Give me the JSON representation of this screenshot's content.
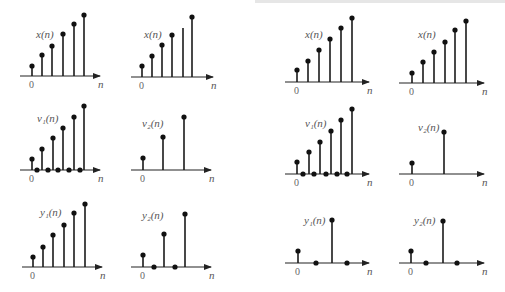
{
  "figure": {
    "colors": {
      "stem": "#1a1a1a",
      "label": "#555555",
      "background": "#ffffff"
    }
  },
  "panels": [
    {
      "id": "L-r1-c1",
      "label": "x(n)",
      "origin_label": "0",
      "axis_label": "n",
      "axis": {
        "x0": 20,
        "x1": 100,
        "y": 76
      },
      "zero_x": 32,
      "label_pos": [
        36,
        38
      ],
      "stems": [
        {
          "x": 32,
          "y": 66
        },
        {
          "x": 42,
          "y": 55
        },
        {
          "x": 52,
          "y": 46
        },
        {
          "x": 63,
          "y": 34
        },
        {
          "x": 74,
          "y": 24
        },
        {
          "x": 84,
          "y": 15
        }
      ],
      "zeros": []
    },
    {
      "id": "L-r1-c2",
      "label": "x(n)",
      "origin_label": "0",
      "axis_label": "n",
      "axis": {
        "x0": 131,
        "x1": 213,
        "y": 77
      },
      "zero_x": 142,
      "label_pos": [
        144,
        38
      ],
      "stems": [
        {
          "x": 142,
          "y": 66
        },
        {
          "x": 152,
          "y": 56
        },
        {
          "x": 162,
          "y": 45
        },
        {
          "x": 172,
          "y": 35
        },
        {
          "x": 183,
          "y": 28,
          "nodot": true
        },
        {
          "x": 192,
          "y": 17
        }
      ],
      "zeros": []
    },
    {
      "id": "L-r2-c1",
      "label": "v₁(n)",
      "origin_label": "0",
      "axis_label": "n",
      "axis": {
        "x0": 20,
        "x1": 100,
        "y": 170
      },
      "zero_x": 32,
      "label_pos": [
        37,
        122
      ],
      "stems": [
        {
          "x": 32,
          "y": 159
        },
        {
          "x": 42,
          "y": 149
        },
        {
          "x": 53,
          "y": 138
        },
        {
          "x": 63,
          "y": 128
        },
        {
          "x": 74,
          "y": 117
        },
        {
          "x": 84,
          "y": 106
        }
      ],
      "zeros": [
        37,
        48,
        58,
        69,
        80
      ]
    },
    {
      "id": "L-r2-c2",
      "label": "v₂(n)",
      "origin_label": "0",
      "axis_label": "n",
      "axis": {
        "x0": 131,
        "x1": 211,
        "y": 170
      },
      "zero_x": 143,
      "label_pos": [
        142,
        127
      ],
      "stems": [
        {
          "x": 143,
          "y": 158
        },
        {
          "x": 163,
          "y": 137
        },
        {
          "x": 184,
          "y": 117
        }
      ],
      "zeros": []
    },
    {
      "id": "L-r3-c1",
      "label": "y₁(n)",
      "origin_label": "0",
      "axis_label": "n",
      "axis": {
        "x0": 22,
        "x1": 102,
        "y": 267
      },
      "zero_x": 33,
      "label_pos": [
        40,
        216
      ],
      "stems": [
        {
          "x": 33,
          "y": 257
        },
        {
          "x": 43,
          "y": 247
        },
        {
          "x": 53,
          "y": 235
        },
        {
          "x": 64,
          "y": 225
        },
        {
          "x": 74,
          "y": 213
        },
        {
          "x": 85,
          "y": 204
        }
      ],
      "zeros": []
    },
    {
      "id": "L-r3-c2",
      "label": "y₂(n)",
      "origin_label": "0",
      "axis_label": "n",
      "axis": {
        "x0": 131,
        "x1": 211,
        "y": 267
      },
      "zero_x": 143,
      "label_pos": [
        142,
        219
      ],
      "stems": [
        {
          "x": 143,
          "y": 255
        },
        {
          "x": 164,
          "y": 234
        },
        {
          "x": 185,
          "y": 214
        }
      ],
      "zeros": [
        154,
        175
      ]
    },
    {
      "id": "R-r1-c1",
      "label": "x(n)",
      "origin_label": "0",
      "axis_label": "n",
      "axis": {
        "x0": 285,
        "x1": 369,
        "y": 82
      },
      "zero_x": 297,
      "label_pos": [
        305,
        38
      ],
      "stems": [
        {
          "x": 297,
          "y": 70
        },
        {
          "x": 308,
          "y": 61
        },
        {
          "x": 319,
          "y": 50
        },
        {
          "x": 330,
          "y": 39
        },
        {
          "x": 341,
          "y": 28
        },
        {
          "x": 352,
          "y": 18
        }
      ],
      "zeros": []
    },
    {
      "id": "R-r1-c2",
      "label": "x(n)",
      "origin_label": "0",
      "axis_label": "n",
      "axis": {
        "x0": 399,
        "x1": 484,
        "y": 83
      },
      "zero_x": 412,
      "label_pos": [
        418,
        38
      ],
      "stems": [
        {
          "x": 412,
          "y": 73
        },
        {
          "x": 423,
          "y": 62
        },
        {
          "x": 434,
          "y": 52
        },
        {
          "x": 445,
          "y": 42
        },
        {
          "x": 455,
          "y": 30
        },
        {
          "x": 466,
          "y": 21
        }
      ],
      "zeros": []
    },
    {
      "id": "R-r2-c1",
      "label": "v₁(n)",
      "origin_label": "0",
      "axis_label": "n",
      "axis": {
        "x0": 285,
        "x1": 369,
        "y": 174
      },
      "zero_x": 297,
      "label_pos": [
        305,
        127
      ],
      "stems": [
        {
          "x": 297,
          "y": 162
        },
        {
          "x": 309,
          "y": 152
        },
        {
          "x": 320,
          "y": 142
        },
        {
          "x": 331,
          "y": 131
        },
        {
          "x": 341,
          "y": 120
        },
        {
          "x": 352,
          "y": 109
        }
      ],
      "zeros": [
        303,
        314,
        326,
        337,
        347
      ]
    },
    {
      "id": "R-r2-c2",
      "label": "v₂(n)",
      "origin_label": "0",
      "axis_label": "n",
      "axis": {
        "x0": 399,
        "x1": 484,
        "y": 174
      },
      "zero_x": 412,
      "label_pos": [
        418,
        131
      ],
      "stems": [
        {
          "x": 412,
          "y": 163
        },
        {
          "x": 444,
          "y": 132
        }
      ],
      "zeros": []
    },
    {
      "id": "R-r3-c1",
      "label": "y₁(n)",
      "origin_label": "0",
      "axis_label": "n",
      "axis": {
        "x0": 285,
        "x1": 369,
        "y": 263
      },
      "zero_x": 298,
      "label_pos": [
        304,
        224
      ],
      "stems": [
        {
          "x": 298,
          "y": 251
        },
        {
          "x": 332,
          "y": 220
        }
      ],
      "zeros": [
        316,
        347
      ]
    },
    {
      "id": "R-r3-c2",
      "label": "y₂(n)",
      "origin_label": "0",
      "axis_label": "n",
      "axis": {
        "x0": 399,
        "x1": 484,
        "y": 263
      },
      "zero_x": 411,
      "label_pos": [
        414,
        224
      ],
      "stems": [
        {
          "x": 411,
          "y": 251
        },
        {
          "x": 443,
          "y": 221
        }
      ],
      "zeros": [
        426,
        457
      ]
    }
  ]
}
